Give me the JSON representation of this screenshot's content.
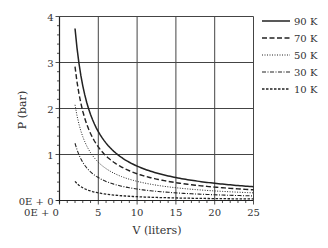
{
  "chart_data": {
    "type": "line",
    "title": "",
    "xlabel": "V (liters)",
    "ylabel": "P (bar)",
    "xlim": [
      0,
      25
    ],
    "ylim": [
      0,
      4
    ],
    "x_ticks": [
      "0E + 0",
      "5",
      "10",
      "15",
      "20",
      "25"
    ],
    "y_ticks": [
      "0E + 0",
      "1",
      "2",
      "3",
      "4"
    ],
    "grid": true,
    "legend_position": "right",
    "series": [
      {
        "name": "90 K",
        "style": "solid",
        "k": 7.48,
        "x_start": 2.0,
        "x": [
          2,
          5,
          10,
          15,
          20,
          25
        ],
        "values": [
          3.74,
          1.5,
          0.75,
          0.5,
          0.37,
          0.3
        ]
      },
      {
        "name": "70 K",
        "style": "dashed",
        "k": 5.82,
        "x_start": 2.0,
        "x": [
          2,
          5,
          10,
          15,
          20,
          25
        ],
        "values": [
          2.91,
          1.16,
          0.58,
          0.39,
          0.29,
          0.23
        ]
      },
      {
        "name": "50 K",
        "style": "dotted",
        "k": 4.16,
        "x_start": 2.0,
        "x": [
          2,
          5,
          10,
          15,
          20,
          25
        ],
        "values": [
          2.08,
          0.83,
          0.42,
          0.28,
          0.21,
          0.17
        ]
      },
      {
        "name": "30 K",
        "style": "dashdot",
        "k": 2.49,
        "x_start": 2.0,
        "x": [
          2,
          5,
          10,
          15,
          20,
          25
        ],
        "values": [
          1.25,
          0.5,
          0.25,
          0.17,
          0.12,
          0.1
        ]
      },
      {
        "name": "10 K",
        "style": "shortdash",
        "k": 0.83,
        "x_start": 2.0,
        "x": [
          2,
          5,
          10,
          15,
          20,
          25
        ],
        "values": [
          0.42,
          0.17,
          0.08,
          0.06,
          0.04,
          0.03
        ]
      }
    ]
  }
}
